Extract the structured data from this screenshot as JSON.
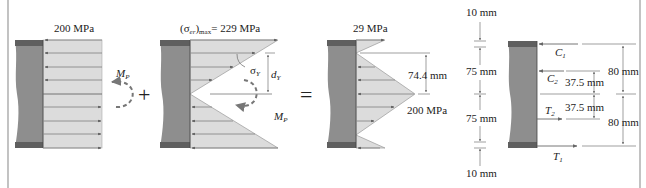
{
  "figure": {
    "type": "stress distribution superposition diagram",
    "colors": {
      "beam_body": "#8e8e8e",
      "beam_flange": "#5f5f5f",
      "stress_fill": "#dcdcdc",
      "stress_line": "#8a8a8a",
      "text": "#222222",
      "frame": "#9a9a9a"
    },
    "operators": {
      "plus": "+",
      "equals": "="
    },
    "panel_plastic": {
      "stress_label": "200 MPa",
      "moment_label": "M",
      "moment_sub": "P"
    },
    "panel_recovery": {
      "stress_label_prefix": "(σ",
      "stress_label_sub": "er",
      "stress_label_mid": ")",
      "stress_label_sub2": "max",
      "stress_label_value": "= 229 MPa",
      "yield_label": "σ",
      "yield_sub": "Y",
      "depth_label": "d",
      "depth_sub": "Y",
      "moment_label": "M",
      "moment_sub": "P"
    },
    "panel_residual": {
      "top_label": "29 MPa",
      "dim_label": "74.4 mm",
      "mid_label": "200 MPa"
    },
    "panel_forces": {
      "left_dims": [
        "10 mm",
        "75 mm",
        "75 mm",
        "10 mm"
      ],
      "forces": [
        {
          "name": "C",
          "sub": "1"
        },
        {
          "name": "C",
          "sub": "2"
        },
        {
          "name": "T",
          "sub": "2"
        },
        {
          "name": "T",
          "sub": "1"
        }
      ],
      "inner_dims": [
        "37.5 mm",
        "37.5 mm"
      ],
      "outer_dims": [
        "80 mm",
        "80 mm"
      ]
    }
  }
}
